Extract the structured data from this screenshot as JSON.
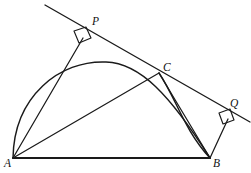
{
  "figure": {
    "canvas": {
      "width": 251,
      "height": 173
    },
    "colors": {
      "stroke": "#1a1a1a",
      "background": "#ffffff",
      "baseline": "#333333"
    },
    "labels": [
      {
        "id": "A",
        "text": "A",
        "x": 4,
        "y": 158,
        "name": "vertex-label-a"
      },
      {
        "id": "B",
        "text": "B",
        "x": 213,
        "y": 158,
        "name": "vertex-label-b"
      },
      {
        "id": "C",
        "text": "C",
        "x": 163,
        "y": 62,
        "name": "vertex-label-c"
      },
      {
        "id": "P",
        "text": "P",
        "x": 92,
        "y": 16,
        "name": "vertex-label-p"
      },
      {
        "id": "Q",
        "text": "Q",
        "x": 230,
        "y": 98,
        "name": "vertex-label-q"
      }
    ],
    "points": {
      "A": {
        "x": 13,
        "y": 158
      },
      "B": {
        "x": 210,
        "y": 158
      },
      "C": {
        "x": 159,
        "y": 73
      },
      "P": {
        "x": 83,
        "y": 38
      },
      "Q": {
        "x": 228,
        "y": 119
      }
    },
    "paths": {
      "baseline_ab": "M 13 158 L 210 158",
      "chord_ac": "M 13 158 L 159 73",
      "chord_cb": "M 159 73 L 210 158",
      "segment_ap": "M 13 158 L 83 38",
      "segment_bq": "M 210 158 L 228 119",
      "tangent_line": "M 45 5 L 250 122",
      "arc_acb": "M 13 158 C 14 96 60 60 106 62 C 140 63 170 95 210 158",
      "arc_cb_inner": "M 159 73 C 176 98 184 130 210 158",
      "right_angle_p": "M 74 31 L 79 43 L 91 38 L 86 27 Z",
      "right_angle_q": "M 219 113 L 223 124 L 234 120 L 230 109 Z"
    },
    "elements": {
      "baseline_label": "segment AB",
      "tangent_label": "tangent at C",
      "arc_label": "arc ACB",
      "inner_arc_label": "arc CB",
      "perp_p_label": "perpendicular AP",
      "perp_q_label": "perpendicular BQ"
    }
  }
}
